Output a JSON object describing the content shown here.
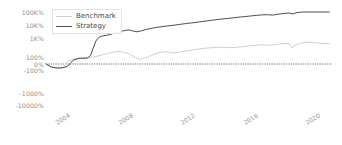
{
  "chart_data": {
    "type": "line",
    "title": "",
    "xlabel": "",
    "ylabel": "",
    "yscale": "symlog",
    "grid": false,
    "legend_position": "upper-left",
    "zero_line": "dotted",
    "y_ticks": [
      {
        "label": "100K%",
        "value": 100000,
        "y_px": 12
      },
      {
        "label": "10K%",
        "value": 10000,
        "y_px": 25
      },
      {
        "label": "1K%",
        "value": 1000,
        "y_px": 38
      },
      {
        "label": "100%",
        "value": 100,
        "y_px": 57
      },
      {
        "label": "0%",
        "value": 0,
        "y_px": 64
      },
      {
        "label": "-100%",
        "value": -100,
        "y_px": 70
      },
      {
        "label": "-1000%",
        "value": -1000,
        "y_px": 93
      },
      {
        "label": "-10000%",
        "value": -10000,
        "y_px": 105
      }
    ],
    "x_ticks": [
      {
        "label": "2004",
        "x_px": 62
      },
      {
        "label": "2008",
        "x_px": 125
      },
      {
        "label": "2012",
        "x_px": 187
      },
      {
        "label": "2016",
        "x_px": 250
      },
      {
        "label": "2020",
        "x_px": 312
      }
    ],
    "series": [
      {
        "name": "Benchmark",
        "color": "#cfcfcf",
        "x": [
          2002.0,
          2002.5,
          2003.0,
          2003.3,
          2003.6,
          2004.0,
          2004.5,
          2005.0,
          2005.5,
          2006.0,
          2006.5,
          2007.0,
          2007.4,
          2007.8,
          2008.2,
          2008.6,
          2009.0,
          2009.3,
          2009.7,
          2010.0,
          2010.5,
          2011.0,
          2011.4,
          2011.8,
          2012.2,
          2012.6,
          2013.0,
          2013.5,
          2014.0,
          2014.5,
          2015.0,
          2015.5,
          2016.0,
          2016.5,
          2017.0,
          2017.5,
          2018.0,
          2018.5,
          2019.0,
          2019.5,
          2020.0,
          2020.25,
          2020.5,
          2021.0,
          2021.5,
          2022.0,
          2022.5,
          2023.0
        ],
        "values": [
          0,
          -12,
          -28,
          -15,
          5,
          25,
          48,
          70,
          95,
          120,
          150,
          178,
          200,
          175,
          140,
          70,
          20,
          55,
          110,
          140,
          175,
          190,
          165,
          175,
          200,
          215,
          245,
          275,
          300,
          315,
          330,
          310,
          320,
          345,
          380,
          410,
          440,
          415,
          455,
          500,
          520,
          300,
          430,
          560,
          610,
          560,
          500,
          520
        ]
      },
      {
        "name": "Strategy",
        "color": "#4d4d4d",
        "x": [
          2002.0,
          2002.4,
          2002.8,
          2003.2,
          2003.6,
          2004.0,
          2004.3,
          2004.6,
          2004.9,
          2005.1,
          2005.3,
          2005.5,
          2005.7,
          2005.9,
          2006.1,
          2006.3,
          2006.6,
          2006.9,
          2007.2,
          2007.5,
          2007.8,
          2008.1,
          2008.4,
          2008.7,
          2009.0,
          2009.3,
          2009.6,
          2010.0,
          2010.4,
          2010.8,
          2011.2,
          2011.6,
          2012.0,
          2012.4,
          2012.8,
          2013.2,
          2013.6,
          2014.0,
          2014.4,
          2014.8,
          2015.2,
          2015.6,
          2016.0,
          2016.4,
          2016.8,
          2017.2,
          2017.6,
          2018.0,
          2018.4,
          2018.8,
          2019.2,
          2019.6,
          2020.0,
          2020.3,
          2020.6,
          2021.0,
          2021.4,
          2021.8,
          2022.2,
          2022.6,
          2023.0
        ],
        "values": [
          0,
          -10,
          -20,
          -18,
          -5,
          10,
          30,
          45,
          40,
          60,
          120,
          300,
          700,
          1100,
          1350,
          1500,
          1700,
          2100,
          2600,
          3100,
          3700,
          4200,
          3600,
          3000,
          3400,
          4200,
          5000,
          6000,
          7000,
          8000,
          9000,
          10000,
          11500,
          13000,
          14500,
          16500,
          18500,
          21000,
          24000,
          27000,
          30000,
          33000,
          37000,
          41000,
          45000,
          50000,
          55000,
          60000,
          62000,
          58000,
          68000,
          76000,
          85000,
          70000,
          90000,
          105000,
          125000,
          140000,
          150000,
          152000,
          155000
        ]
      }
    ]
  },
  "legend": {
    "entries": [
      {
        "label": "Benchmark",
        "color": "#cfcfcf"
      },
      {
        "label": "Strategy",
        "color": "#4d4d4d"
      }
    ]
  }
}
